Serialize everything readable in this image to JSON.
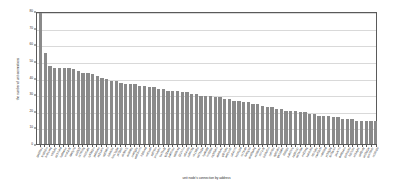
{
  "chart_data": {
    "type": "bar",
    "title": "",
    "xlabel": "unit node's connection by address",
    "ylabel": "the number of unit connections",
    "ylim": [
      0,
      80
    ],
    "yticks": [
      0,
      10,
      20,
      30,
      40,
      50,
      60,
      70,
      80
    ],
    "grid": true,
    "legend": false,
    "bar_color": "#8a8a8a",
    "frame_color": "#5a5a5a",
    "gridline_color": "#d9d9d9",
    "categories": [
      "gwj20p1",
      "fc18k2m",
      "bn91x4q",
      "tr55v8z",
      "qk37n6d",
      "hs84w1c",
      "vm62r9t",
      "ld40y7b",
      "zp29j5f",
      "cx76h3g",
      "nb15u8k",
      "ry93d2m",
      "jw68s4p",
      "ek21a7v",
      "ug59l6n",
      "ts84c3x",
      "hm17q9w",
      "pf72b5r",
      "dv36k1j",
      "az90t8y",
      "cn45g2s",
      "wb63m7h",
      "ki28v4d",
      "xo51p9l",
      "rq87f3n",
      "ym14z6c",
      "bu79e2t",
      "lg32w8k",
      "pa65n1v",
      "sd98r4q",
      "fj21h7m",
      "ot54x3b",
      "zv86c9g",
      "nk19l5p",
      "ed73s2w",
      "hy46d8f",
      "mr92t1k",
      "cq35b6n",
      "ab68v4x",
      "gl27p9s",
      "wt81m3r",
      "ju54c7h",
      "kp16y2d",
      "vz79n8l",
      "fs43g1b",
      "dm85w6q",
      "xe38k4v",
      "nh71r9t",
      "br24p5m",
      "cy67l3c",
      "tg95x8n",
      "qw12d6k",
      "li58b2v",
      "pu83h7s",
      "za36m1r",
      "od74c9w",
      "ev21t4g",
      "ks69n5b",
      "hf17p8x",
      "mw52v3l",
      "rn86k6d",
      "yc39g2q",
      "tb75w1h",
      "ja14r7n",
      "dx68s4m",
      "gv91b9p",
      "lo27c3v",
      "ek54y6k",
      "sp82n8t",
      "uz35d1w",
      "qm79h5r",
      "nc18x2b"
    ],
    "values": [
      79,
      55,
      47,
      46,
      46,
      46,
      46,
      45,
      44,
      43,
      43,
      42,
      41,
      40,
      39,
      38,
      38,
      37,
      36,
      36,
      36,
      35,
      35,
      34,
      34,
      33,
      33,
      32,
      32,
      32,
      31,
      31,
      30,
      30,
      29,
      29,
      29,
      28,
      28,
      27,
      27,
      26,
      26,
      25,
      25,
      24,
      24,
      23,
      22,
      22,
      21,
      21,
      20,
      20,
      20,
      19,
      19,
      18,
      18,
      17,
      17,
      17,
      16,
      16,
      15,
      15,
      15,
      14,
      14,
      14,
      14,
      14
    ]
  }
}
